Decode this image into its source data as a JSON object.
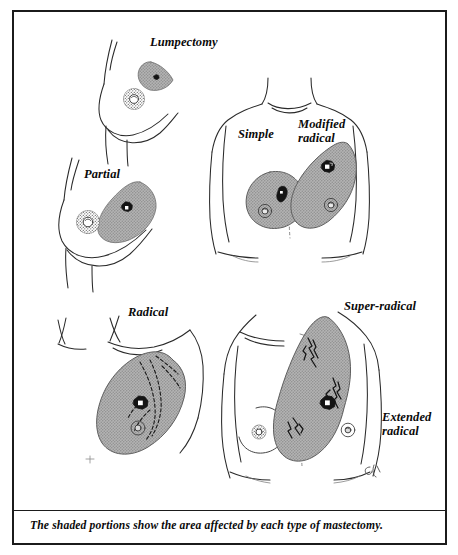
{
  "figure": {
    "title_labels": {
      "lumpectomy": "Lumpectomy",
      "partial": "Partial",
      "simple": "Simple",
      "modified_radical": "Modified\nradical",
      "radical": "Radical",
      "super_radical": "Super-radical",
      "extended_radical": "Extended\nradical"
    },
    "caption": "The shaded portions show the area affected by each type of mastectomy.",
    "colors": {
      "ink": "#1b1b1b",
      "line": "#2a2a2a",
      "shade_fill": "#a8a8a8",
      "tumor": "#151515",
      "background": "#ffffff",
      "frame": "#1b1b1b"
    },
    "panels": [
      {
        "name": "lumpectomy",
        "view": "side-profile-breast",
        "label": "Lumpectomy",
        "shaded_region": "small lens-shaped wedge above nipple",
        "has_tumor": true
      },
      {
        "name": "partial",
        "view": "side-profile-breast",
        "label": "Partial",
        "shaded_region": "large lens-shaped wedge through upper breast",
        "has_tumor": true
      },
      {
        "name": "simple",
        "view": "frontal-torso-left-breast",
        "label": "Simple",
        "shaded_region": "round breast mound only",
        "has_tumor": true
      },
      {
        "name": "modified-radical",
        "view": "frontal-torso-right-breast",
        "label": "Modified radical",
        "shaded_region": "breast plus axillary tail",
        "has_tumor": true
      },
      {
        "name": "radical",
        "view": "oblique-chest",
        "label": "Radical",
        "shaded_region": "breast, pectoral muscle and axillary nodes",
        "has_tumor": true,
        "has_lymphatic_vessels": true
      },
      {
        "name": "super-radical",
        "view": "frontal-torso-oblique",
        "label": "Super-radical",
        "shaded_region": "breast, chest wall, internal mammary and supraclavicular nodes",
        "has_tumor": true,
        "has_lymphatic_vessels": true
      },
      {
        "name": "extended-radical",
        "view": "annotation-only",
        "label": "Extended radical",
        "shaded_region": "refers to super-radical field",
        "has_tumor": false
      }
    ]
  }
}
